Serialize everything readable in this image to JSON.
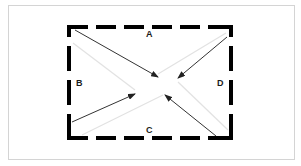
{
  "diagram": {
    "title": "",
    "colors": {
      "frame_border": "#d4d4d4",
      "dashed_rect": "#000000",
      "arrow": "#333333",
      "guide_line": "#e2e2e2",
      "label": "#1a1a1a"
    },
    "labels": [
      {
        "id": "A",
        "text": "A",
        "side": "top",
        "x": 146,
        "y": 30
      },
      {
        "id": "B",
        "text": "B",
        "side": "left",
        "x": 76,
        "y": 79
      },
      {
        "id": "C",
        "text": "C",
        "side": "bottom",
        "x": 146,
        "y": 126
      },
      {
        "id": "D",
        "text": "D",
        "side": "right",
        "x": 217,
        "y": 79
      }
    ],
    "dashed_rectangle": {
      "x1": 69,
      "y1": 27,
      "x2": 231,
      "y2": 138,
      "stroke_width": 4
    },
    "arrows": [
      {
        "name": "arrow-top-left",
        "from": [
          75,
          30
        ],
        "to": [
          158,
          77
        ]
      },
      {
        "name": "arrow-top-right",
        "from": [
          227,
          37
        ],
        "to": [
          178,
          78
        ]
      },
      {
        "name": "arrow-bottom-left",
        "from": [
          72,
          122
        ],
        "to": [
          135,
          94
        ]
      },
      {
        "name": "arrow-bottom-right",
        "from": [
          216,
          136
        ],
        "to": [
          165,
          95
        ]
      }
    ],
    "guide_lines": [
      {
        "name": "guide-line-top-left",
        "from": [
          73,
          43
        ],
        "to": [
          135,
          90
        ]
      },
      {
        "name": "guide-line-top-right",
        "from": [
          226,
          33
        ],
        "to": [
          158,
          74
        ]
      },
      {
        "name": "guide-line-bottom-left",
        "from": [
          82,
          135
        ],
        "to": [
          163,
          95
        ]
      },
      {
        "name": "guide-line-bottom-right",
        "from": [
          178,
          82
        ],
        "to": [
          228,
          130
        ]
      }
    ]
  }
}
